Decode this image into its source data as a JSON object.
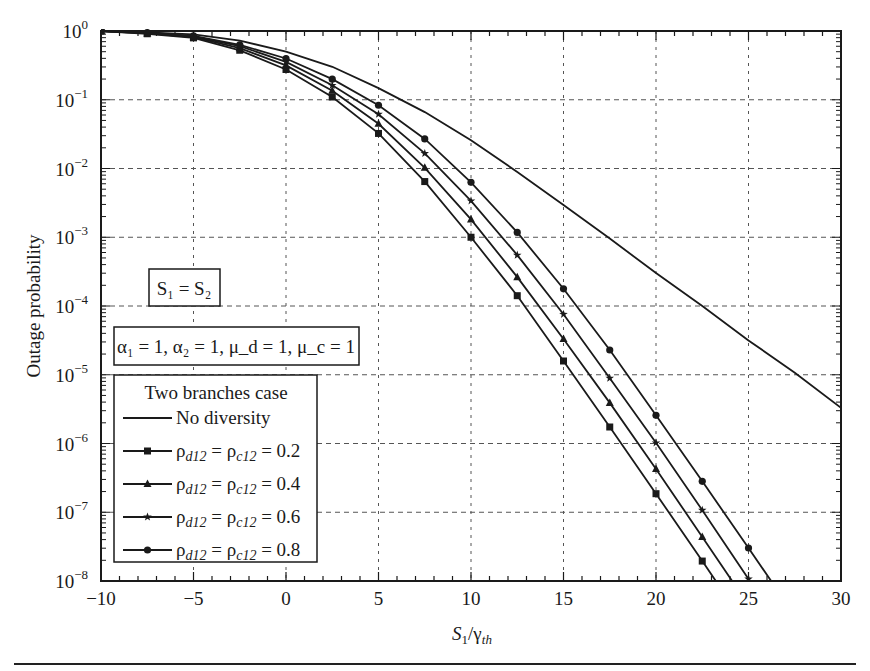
{
  "chart_data": {
    "type": "line",
    "title": "",
    "xlabel": "S1/γth",
    "xlabel_parts": {
      "main": "S",
      "sub1": "1",
      "slash": "/γ",
      "sub2": "th"
    },
    "ylabel": "Outage probability",
    "xlim": [
      -10,
      30
    ],
    "ylim": [
      1e-08,
      1
    ],
    "yscale": "log",
    "grid": true,
    "x_ticks": [
      -10,
      -5,
      0,
      5,
      10,
      15,
      20,
      25,
      30
    ],
    "y_tick_exponents": [
      0,
      -1,
      -2,
      -3,
      -4,
      -5,
      -6,
      -7,
      -8
    ],
    "annotations": [
      {
        "text": "S1 = S2",
        "display": "S₁ = S₂"
      },
      {
        "text": "α1 = 1, α2 = 1, μd = 1, μc = 1",
        "display": "α₁ = 1, α₂ = 1, μ_d = 1, μ_c = 1"
      }
    ],
    "legend": {
      "title": "Two branches case",
      "position": "lower left",
      "entries": [
        "No diversity",
        "ρd12 = ρc12 = 0.2",
        "ρd12 = ρc12 = 0.4",
        "ρd12 = ρc12 = 0.6",
        "ρd12 = ρc12 = 0.8"
      ]
    },
    "series": [
      {
        "name": "No diversity",
        "marker": "none",
        "x": [
          -10,
          -7.5,
          -5,
          -2.5,
          0,
          2.5,
          5,
          7.5,
          10,
          12.5,
          15,
          17.5,
          20,
          22.5,
          25,
          27.5,
          30
        ],
        "log10_y": [
          0,
          -0.02,
          -0.05,
          -0.14,
          -0.3,
          -0.52,
          -0.83,
          -1.18,
          -1.59,
          -2.05,
          -2.53,
          -3.02,
          -3.52,
          -4.0,
          -4.5,
          -4.97,
          -5.48
        ]
      },
      {
        "name": "ρd12 = ρc12 = 0.2",
        "marker": "square",
        "x": [
          -10,
          -7.5,
          -5,
          -2.5,
          0,
          2.5,
          5,
          7.5,
          10,
          12.5,
          15,
          17.5,
          20,
          22.5,
          25
        ],
        "log10_y": [
          0,
          -0.04,
          -0.1,
          -0.28,
          -0.56,
          -0.96,
          -1.49,
          -2.19,
          -3.0,
          -3.85,
          -4.8,
          -5.76,
          -6.73,
          -7.71,
          -8.7
        ]
      },
      {
        "name": "ρd12 = ρc12 = 0.4",
        "marker": "triangle",
        "x": [
          -10,
          -7.5,
          -5,
          -2.5,
          0,
          2.5,
          5,
          7.5,
          10,
          12.5,
          15,
          17.5,
          20,
          22.5,
          25
        ],
        "log10_y": [
          0,
          -0.035,
          -0.09,
          -0.25,
          -0.5,
          -0.87,
          -1.35,
          -1.99,
          -2.74,
          -3.58,
          -4.48,
          -5.41,
          -6.37,
          -7.36,
          -8.35
        ]
      },
      {
        "name": "ρd12 = ρc12 = 0.6",
        "marker": "star",
        "x": [
          -10,
          -7.5,
          -5,
          -2.5,
          0,
          2.5,
          5,
          7.5,
          10,
          12.5,
          15,
          17.5,
          20,
          22.5,
          25
        ],
        "log10_y": [
          0,
          -0.03,
          -0.08,
          -0.22,
          -0.45,
          -0.79,
          -1.21,
          -1.78,
          -2.47,
          -3.26,
          -4.12,
          -5.05,
          -5.99,
          -6.97,
          -7.97
        ]
      },
      {
        "name": "ρd12 = ρc12 = 0.8",
        "marker": "circle",
        "x": [
          -10,
          -7.5,
          -5,
          -2.5,
          0,
          2.5,
          5,
          7.5,
          10,
          12.5,
          15,
          17.5,
          20,
          22.5,
          25,
          27.5
        ],
        "log10_y": [
          0,
          -0.025,
          -0.07,
          -0.2,
          -0.4,
          -0.7,
          -1.08,
          -1.57,
          -2.2,
          -2.93,
          -3.75,
          -4.64,
          -5.59,
          -6.55,
          -7.52,
          -8.5
        ]
      }
    ]
  },
  "colors": {
    "line": "#1a1a1a",
    "grid": "#555555",
    "background": "#ffffff"
  }
}
